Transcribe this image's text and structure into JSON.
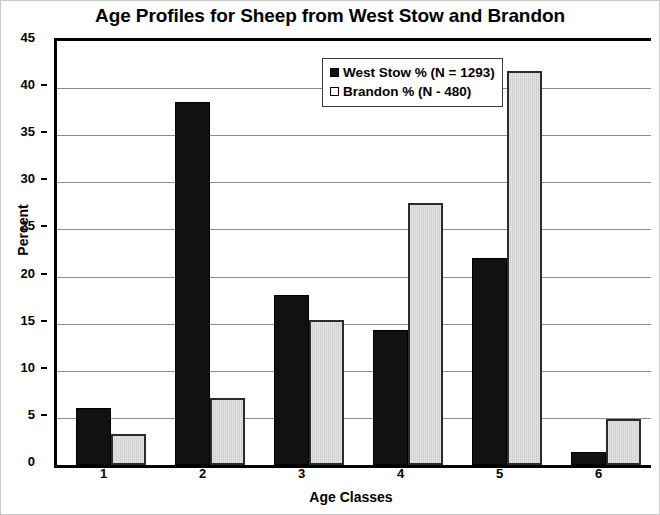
{
  "chart_data": {
    "type": "bar",
    "title": "Age Profiles for Sheep from West Stow and Brandon",
    "xlabel": "Age Classes",
    "ylabel": "Percent",
    "categories": [
      "1",
      "2",
      "3",
      "4",
      "5",
      "6"
    ],
    "series": [
      {
        "name": "West Stow % (N = 1293)",
        "color": "#111111",
        "values": [
          6.1,
          38.5,
          18.0,
          14.3,
          22.0,
          1.4
        ]
      },
      {
        "name": "Brandon % (N - 480)",
        "color": "#dcdcdc",
        "values": [
          3.3,
          7.1,
          15.4,
          27.8,
          41.8,
          4.9
        ]
      }
    ],
    "ylim": [
      0,
      45
    ],
    "yticks": [
      0,
      5,
      10,
      15,
      20,
      25,
      30,
      35,
      40,
      45
    ],
    "ytick_labels": [
      "0",
      "5",
      "10",
      "15",
      "20",
      "25",
      "30",
      "35",
      "40",
      "45"
    ],
    "grid": true,
    "legend_position": "top-center-right"
  },
  "legend": {
    "items": [
      {
        "label": "West Stow % (N = 1293)",
        "swatch": "filled-square"
      },
      {
        "label": "Brandon % (N - 480)",
        "swatch": "open-square"
      }
    ]
  }
}
